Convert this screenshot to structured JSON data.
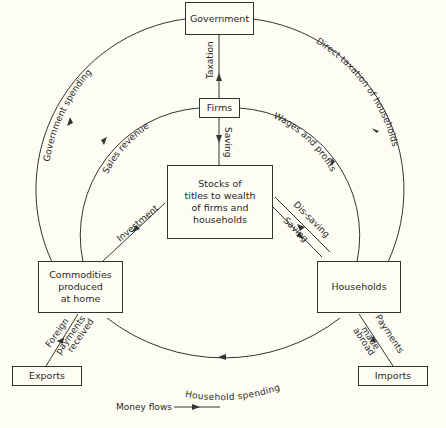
{
  "nodes": {
    "government": "Government",
    "firms": "Firms",
    "stocks": [
      "Stocks of",
      "titles to wealth",
      "of firms and",
      "households"
    ],
    "commodities": [
      "Commodities",
      "produced",
      "at home"
    ],
    "households": "Households",
    "exports": "Exports",
    "imports": "Imports"
  },
  "flows": {
    "taxation": "Taxation",
    "saving_firms": "Saving",
    "government_spending": "Government spending",
    "sales_revenue": "Sales revenue",
    "direct_taxation": "Direct taxation of households",
    "wages_profits": "Wages and profits",
    "investment": "Investment",
    "dis_saving": "Dis-saving",
    "saving_households": "Saving",
    "household_spending": "Household spending",
    "foreign_payments": [
      "Foreign",
      "payments",
      "received"
    ],
    "payments_abroad": [
      "Payments",
      "made",
      "abroad"
    ]
  },
  "legend": {
    "label": "Money flows"
  },
  "colors": {
    "background": "#fdfdf4",
    "line": "#333333"
  }
}
